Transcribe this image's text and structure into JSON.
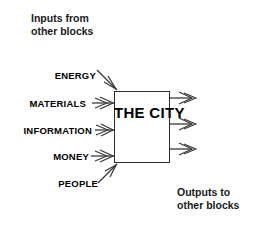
{
  "diagram": {
    "title_block": "THE CITY",
    "title_lines": [
      "THE",
      "CITY"
    ],
    "captions": {
      "inputs": "Inputs from\nother blocks",
      "outputs": "Outputs to\nother blocks"
    },
    "inputs": [
      {
        "label": "ENERGY",
        "direction": "down-right"
      },
      {
        "label": "MATERIALS",
        "direction": "right"
      },
      {
        "label": "INFORMATION",
        "direction": "right"
      },
      {
        "label": "MONEY",
        "direction": "right"
      },
      {
        "label": "PEOPLE",
        "direction": "up-right"
      }
    ],
    "outputs": [
      {
        "label": "",
        "direction": "right"
      },
      {
        "label": "",
        "direction": "right"
      },
      {
        "label": "",
        "direction": "right"
      }
    ],
    "colors": {
      "background": "#ffffff",
      "box_stroke": "#2b2b2b",
      "arrow_stroke": "#3a3a3a",
      "text": "#000000",
      "caption_text": "#1a1a1a"
    }
  }
}
